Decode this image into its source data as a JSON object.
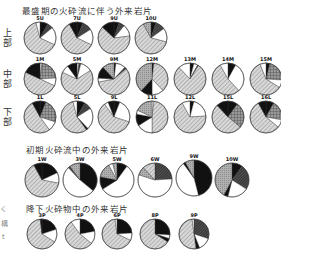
{
  "titles": {
    "main": "最盛期の火砕流に伴う外来岩片",
    "early": "初期火砕流中の外来岩片",
    "fall": "降下火砕物中の外来岩片"
  },
  "side_labels": {
    "upper": "上部",
    "middle": "中部",
    "lower": "下部"
  },
  "edge_fragments": [
    "く",
    "構",
    "t"
  ],
  "patterns": {
    "diag": "#bdbdbd",
    "white": "#ffffff",
    "black": "#111111",
    "dark": "#444444",
    "grid": "#888888",
    "gray": "#a8a8a8"
  },
  "chart_data": {
    "type": "pie",
    "note": "Proportions estimated from pie segment angles; categories are unlabeled fill patterns (light diagonal hatch, white, black, dark hatch, grid, gray).",
    "groups": [
      {
        "name": "上部",
        "row": "upper",
        "pies": [
          {
            "label": "5U",
            "cx": 40,
            "cy": 38,
            "r": 16,
            "segments": [
              [
                "black",
                8
              ],
              [
                "dark",
                6
              ],
              [
                "white",
                18
              ],
              [
                "diag",
                64
              ],
              [
                "white",
                4
              ]
            ]
          },
          {
            "label": "7U",
            "cx": 77,
            "cy": 38,
            "r": 16,
            "segments": [
              [
                "black",
                6
              ],
              [
                "dark",
                10
              ],
              [
                "white",
                16
              ],
              [
                "diag",
                60
              ],
              [
                "black",
                8
              ]
            ]
          },
          {
            "label": "9U",
            "cx": 114,
            "cy": 38,
            "r": 16,
            "segments": [
              [
                "black",
                5
              ],
              [
                "dark",
                6
              ],
              [
                "white",
                12
              ],
              [
                "diag",
                64
              ],
              [
                "black",
                13
              ]
            ]
          },
          {
            "label": "10U",
            "cx": 151,
            "cy": 38,
            "r": 16,
            "segments": [
              [
                "black",
                5
              ],
              [
                "dark",
                10
              ],
              [
                "white",
                14
              ],
              [
                "diag",
                63
              ],
              [
                "gray",
                8
              ]
            ]
          }
        ]
      },
      {
        "name": "中部",
        "row": "middle",
        "pies": [
          {
            "label": "1M",
            "cx": 40,
            "cy": 79,
            "r": 16,
            "segments": [
              [
                "white",
                2
              ],
              [
                "grid",
                22
              ],
              [
                "white",
                8
              ],
              [
                "diag",
                50
              ],
              [
                "black",
                18
              ]
            ]
          },
          {
            "label": "5M",
            "cx": 77,
            "cy": 79,
            "r": 16,
            "segments": [
              [
                "white",
                2
              ],
              [
                "dark",
                2
              ],
              [
                "white",
                12
              ],
              [
                "diag",
                66
              ],
              [
                "white",
                8
              ],
              [
                "black",
                10
              ]
            ]
          },
          {
            "label": "9M",
            "cx": 114,
            "cy": 79,
            "r": 16,
            "segments": [
              [
                "black",
                2
              ],
              [
                "white",
                10
              ],
              [
                "dark",
                2
              ],
              [
                "diag",
                58
              ],
              [
                "white",
                4
              ],
              [
                "black",
                12
              ],
              [
                "gray",
                12
              ]
            ]
          },
          {
            "label": "12M",
            "cx": 152,
            "cy": 79,
            "r": 16,
            "segments": [
              [
                "black",
                2
              ],
              [
                "diag",
                36
              ],
              [
                "white",
                12
              ],
              [
                "black",
                12
              ],
              [
                "gray",
                38
              ]
            ]
          },
          {
            "label": "13M",
            "cx": 190,
            "cy": 79,
            "r": 16,
            "segments": [
              [
                "black",
                4
              ],
              [
                "white",
                4
              ],
              [
                "dark",
                1
              ],
              [
                "diag",
                79
              ],
              [
                "white",
                12
              ]
            ]
          },
          {
            "label": "14M",
            "cx": 228,
            "cy": 79,
            "r": 16,
            "segments": [
              [
                "black",
                8
              ],
              [
                "white",
                30
              ],
              [
                "diag",
                54
              ],
              [
                "white",
                8
              ]
            ]
          },
          {
            "label": "15M",
            "cx": 266,
            "cy": 79,
            "r": 16,
            "segments": [
              [
                "black",
                4
              ],
              [
                "grid",
                22
              ],
              [
                "white",
                8
              ],
              [
                "diag",
                60
              ],
              [
                "white",
                6
              ]
            ]
          }
        ]
      },
      {
        "name": "下部",
        "row": "lower",
        "pies": [
          {
            "label": "1L",
            "cx": 40,
            "cy": 117,
            "r": 16,
            "segments": [
              [
                "black",
                6
              ],
              [
                "grid",
                24
              ],
              [
                "white",
                10
              ],
              [
                "diag",
                52
              ],
              [
                "black",
                8
              ]
            ]
          },
          {
            "label": "5L",
            "cx": 77,
            "cy": 117,
            "r": 16,
            "segments": [
              [
                "black",
                8
              ],
              [
                "dark",
                8
              ],
              [
                "white",
                22
              ],
              [
                "black",
                2
              ],
              [
                "diag",
                56
              ],
              [
                "white",
                4
              ]
            ]
          },
          {
            "label": "9L",
            "cx": 114,
            "cy": 117,
            "r": 16,
            "segments": [
              [
                "black",
                6
              ],
              [
                "white",
                24
              ],
              [
                "diag",
                60
              ],
              [
                "white",
                4
              ],
              [
                "black",
                6
              ]
            ]
          },
          {
            "label": "11L",
            "cx": 152,
            "cy": 117,
            "r": 16,
            "segments": [
              [
                "white",
                2
              ],
              [
                "diag",
                48
              ],
              [
                "white",
                16
              ],
              [
                "black",
                12
              ],
              [
                "white",
                4
              ],
              [
                "gray",
                18
              ]
            ]
          },
          {
            "label": "12L",
            "cx": 190,
            "cy": 117,
            "r": 16,
            "segments": [
              [
                "black",
                4
              ],
              [
                "white",
                20
              ],
              [
                "diag",
                68
              ],
              [
                "white",
                8
              ]
            ]
          },
          {
            "label": "15L",
            "cx": 228,
            "cy": 117,
            "r": 16,
            "segments": [
              [
                "black",
                10
              ],
              [
                "grid",
                26
              ],
              [
                "diag",
                52
              ],
              [
                "black",
                12
              ]
            ]
          },
          {
            "label": "16L",
            "cx": 266,
            "cy": 117,
            "r": 16,
            "segments": [
              [
                "black",
                8
              ],
              [
                "grid",
                20
              ],
              [
                "white",
                8
              ],
              [
                "diag",
                56
              ],
              [
                "black",
                8
              ]
            ]
          }
        ]
      },
      {
        "name": "初期火砕流中の外来岩片",
        "row": "early",
        "pies": [
          {
            "label": "1W",
            "cx": 42,
            "cy": 180,
            "r": 17,
            "segments": [
              [
                "black",
                18
              ],
              [
                "white",
                10
              ],
              [
                "diag",
                64
              ],
              [
                "black",
                8
              ]
            ]
          },
          {
            "label": "3W",
            "cx": 80,
            "cy": 180,
            "r": 17,
            "segments": [
              [
                "black",
                36
              ],
              [
                "white",
                52
              ],
              [
                "dark",
                2
              ],
              [
                "gray",
                10
              ]
            ]
          },
          {
            "label": "5W",
            "cx": 117,
            "cy": 180,
            "r": 17,
            "segments": [
              [
                "black",
                10
              ],
              [
                "white",
                56
              ],
              [
                "black",
                12
              ],
              [
                "gray",
                14
              ],
              [
                "white",
                4
              ],
              [
                "gray",
                4
              ]
            ]
          },
          {
            "label": "6W",
            "cx": 155,
            "cy": 180,
            "r": 17,
            "segments": [
              [
                "dark",
                24
              ],
              [
                "white",
                56
              ],
              [
                "gray",
                8
              ],
              [
                "diag",
                12
              ]
            ]
          },
          {
            "label": "9W",
            "cx": 194,
            "cy": 178,
            "r": 18,
            "segments": [
              [
                "black",
                46
              ],
              [
                "white",
                44
              ],
              [
                "black",
                2
              ],
              [
                "gray",
                8
              ]
            ]
          },
          {
            "label": "10W",
            "cx": 232,
            "cy": 180,
            "r": 17,
            "segments": [
              [
                "black",
                10
              ],
              [
                "dark",
                24
              ],
              [
                "white",
                20
              ],
              [
                "black",
                4
              ],
              [
                "gray",
                42
              ]
            ]
          }
        ]
      },
      {
        "name": "降下火砕物中の外来岩片",
        "row": "fall",
        "pies": [
          {
            "label": "3P",
            "cx": 42,
            "cy": 234,
            "r": 15,
            "segments": [
              [
                "black",
                20
              ],
              [
                "white",
                14
              ],
              [
                "diag",
                64
              ],
              [
                "black",
                2
              ]
            ]
          },
          {
            "label": "4P",
            "cx": 80,
            "cy": 234,
            "r": 15,
            "segments": [
              [
                "black",
                22
              ],
              [
                "white",
                14
              ],
              [
                "diag",
                54
              ],
              [
                "white",
                10
              ]
            ]
          },
          {
            "label": "6P",
            "cx": 117,
            "cy": 234,
            "r": 15,
            "segments": [
              [
                "black",
                24
              ],
              [
                "white",
                8
              ],
              [
                "diag",
                66
              ],
              [
                "white",
                2
              ]
            ]
          },
          {
            "label": "8P",
            "cx": 155,
            "cy": 234,
            "r": 15,
            "segments": [
              [
                "black",
                26
              ],
              [
                "white",
                4
              ],
              [
                "black",
                4
              ],
              [
                "diag",
                66
              ]
            ]
          },
          {
            "label": "9P",
            "cx": 194,
            "cy": 234,
            "r": 15,
            "segments": [
              [
                "dark",
                30
              ],
              [
                "white",
                14
              ],
              [
                "black",
                4
              ],
              [
                "diag",
                50
              ],
              [
                "white",
                2
              ]
            ]
          }
        ]
      }
    ]
  }
}
